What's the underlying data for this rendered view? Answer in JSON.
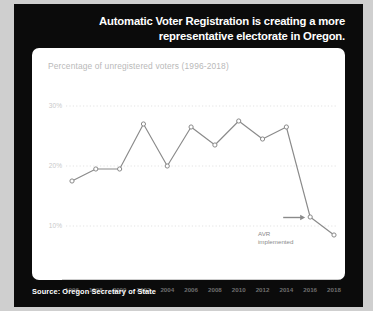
{
  "card": {
    "title": "Automatic Voter Registration is creating a more representative electorate in Oregon.",
    "source": "Source: Oregon Secretary of State",
    "bg_color": "#0b0b0b",
    "panel_color": "#ffffff",
    "title_color": "#ffffff"
  },
  "chart_data": {
    "type": "line",
    "title": "Percentage of unregistered voters (1996-2018)",
    "xlabel": "",
    "ylabel": "",
    "categories": [
      "1996",
      "1998",
      "2000",
      "2002",
      "2004",
      "2006",
      "2008",
      "2010",
      "2012",
      "2014",
      "2016",
      "2018"
    ],
    "values": [
      17.5,
      19.5,
      19.5,
      27.0,
      20.0,
      26.5,
      23.5,
      27.5,
      24.5,
      26.5,
      11.5,
      8.5
    ],
    "ylim": [
      5,
      32
    ],
    "yticks": [
      10,
      20,
      30
    ],
    "ytick_labels": [
      "10%",
      "20%",
      "30%"
    ],
    "grid": true,
    "legend": "none",
    "line_color": "#8a8a8a",
    "marker_color": "#ffffff",
    "grid_color": "#dcdcdc",
    "annotations": [
      {
        "text_line1": "AVR",
        "text_line2": "implemented",
        "target_category": "2016",
        "arrow": "right-arrow"
      }
    ]
  }
}
